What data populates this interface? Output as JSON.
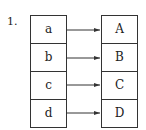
{
  "label": "1.",
  "domain_set": [
    "a",
    "b",
    "c",
    "d"
  ],
  "codomain_set": [
    "A",
    "B",
    "C",
    "D"
  ],
  "mapping": [
    {
      "from": "a",
      "to": "A"
    },
    {
      "from": "b",
      "to": "B"
    },
    {
      "from": "c",
      "to": "C"
    },
    {
      "from": "d",
      "to": "D"
    }
  ]
}
